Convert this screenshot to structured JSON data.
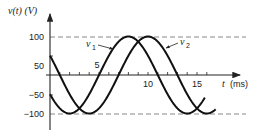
{
  "chart_data": {
    "type": "line",
    "title": "",
    "xlabel": "t (ms)",
    "ylabel": "v(t) (V)",
    "xlim": [
      0,
      19.5
    ],
    "ylim": [
      -100,
      100
    ],
    "x_ticks": [
      5,
      10,
      15
    ],
    "x_minor_ticks": [
      1,
      2,
      3,
      4,
      5,
      6,
      7,
      8,
      9,
      10,
      11,
      12,
      13,
      14,
      15,
      16
    ],
    "y_ticks": [
      100,
      50,
      -50,
      -100
    ],
    "reference_lines": [
      {
        "y": 100,
        "style": "dashed"
      },
      {
        "y": -100,
        "style": "dashed"
      }
    ],
    "grid": false,
    "legend": "inline annotations with arrows",
    "series": [
      {
        "name": "v1",
        "label": "v",
        "subscript": "1",
        "formula": "100 cos(2π(t - 8)/12)",
        "amplitude": 100,
        "period_ms": 12,
        "peak_t_ms": 8,
        "t_range": [
          0,
          15.8
        ],
        "v_at_t0": -50
      },
      {
        "name": "v2",
        "label": "v",
        "subscript": "2",
        "formula": "100 cos(2π(t - 10)/12)",
        "amplitude": 100,
        "period_ms": 12,
        "peak_t_ms": 10,
        "t_range": [
          0,
          16.9
        ],
        "v_at_t0": 50
      }
    ]
  },
  "axis": {
    "y_label_main": "v(t) (V)",
    "x_label_t": "t",
    "x_label_unit": "(ms)",
    "y_tick_labels": [
      "100",
      "50",
      "−50",
      "−100"
    ],
    "x_tick_labels": [
      "5",
      "10",
      "15"
    ]
  },
  "annotations": {
    "v1_main": "v",
    "v1_sub": "1",
    "v2_main": "v",
    "v2_sub": "2"
  }
}
